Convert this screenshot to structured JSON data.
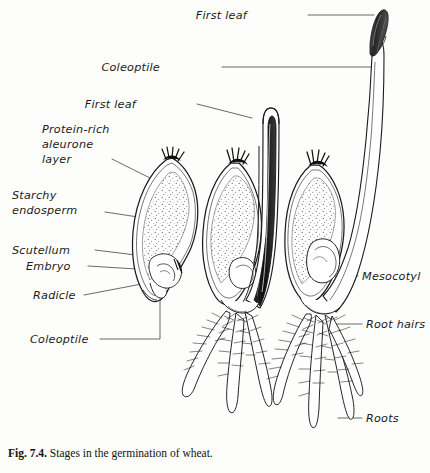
{
  "figure": {
    "caption_label": "Fig. 7.4.",
    "caption_text": "Stages in the germination of wheat.",
    "background_color": "#fdfdfb",
    "ink_color": "#1b1b1b"
  },
  "labels": {
    "first_leaf_top": "First leaf",
    "coleoptile_top": "Coleoptile",
    "first_leaf_mid": "First leaf",
    "protein_rich_1": "Protein-rich",
    "protein_rich_2": "aleurone",
    "protein_rich_3": "layer",
    "starchy_1": "Starchy",
    "starchy_2": "endosperm",
    "scutellum": "Scutellum",
    "embryo": "Embryo",
    "radicle": "Radicle",
    "coleoptile_left": "Coleoptile",
    "mesocotyl": "Mesocotyl",
    "root_hairs": "Root hairs",
    "roots": "Roots"
  },
  "stages": [
    {
      "name": "ungerminated-grain",
      "order": 1,
      "description": "Dry wheat grain in section showing aleurone layer, starchy endosperm, scutellum, embryo, radicle and coleoptile"
    },
    {
      "name": "early-germination",
      "order": 2,
      "description": "Grain with coleoptile and dark first leaf emerging upward, seminal roots with root hairs below"
    },
    {
      "name": "late-germination",
      "order": 3,
      "description": "Grain with elongated coleoptile, first leaf breaking through tip, mesocotyl and extensive root system with root hairs"
    }
  ]
}
